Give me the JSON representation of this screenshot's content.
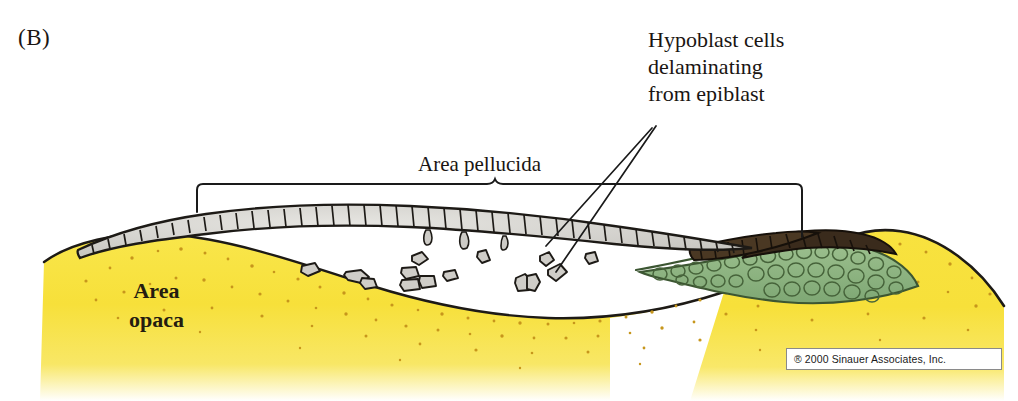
{
  "figure": {
    "panel_label": "(B)",
    "type": "biological-diagram",
    "background_color": "#ffffff"
  },
  "labels": {
    "callout_text": "Hypoblast cells\ndelaminating\nfrom epiblast",
    "area_pellucida": "Area pellucida",
    "area_opaca": "Area\nopaca"
  },
  "copyright": {
    "text": "® 2000 Sinauer Associates, Inc."
  },
  "colors": {
    "area_opaca_yellow": "#f7e03a",
    "area_opaca_speckle": "#c79a1e",
    "epiblast_cell_fill": "#d9d8d4",
    "epiblast_outline": "#1d1a16",
    "dark_cells": "#3b2c1d",
    "hypoblast_green": "#8fb882",
    "hypoblast_green_outline": "#3f5a33",
    "loose_cell_fill": "#cfcdc8",
    "line_color": "#1a1a1a",
    "label_text": "#1a1512"
  },
  "structures": [
    {
      "name": "epiblast",
      "description": "single columnar cell layer arcing across top",
      "cell_count": 52
    },
    {
      "name": "hypoblast",
      "description": "green cell mass at right beneath epiblast"
    },
    {
      "name": "area-opaca",
      "description": "yellow speckled yolk region at left and right"
    },
    {
      "name": "delaminating-cells",
      "description": "loose gray cells in blastocoel cavity",
      "count": 14
    },
    {
      "name": "koller-sickle-dark-cells",
      "description": "dark brown cells at right of epiblast"
    }
  ],
  "annotations": {
    "brace": {
      "left_x": 197,
      "right_x": 802,
      "top_y": 212,
      "peak_x": 495
    },
    "leader_lines": 2
  }
}
